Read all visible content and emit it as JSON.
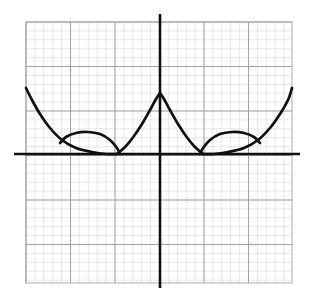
{
  "figure": {
    "kind": "math-function-graph",
    "title": "",
    "background_color": "#ffffff",
    "width": 310,
    "height": 288
  },
  "grid": {
    "minor_color": "#c9ccd2",
    "major_color": "#9a9ea6",
    "frame_color": "#a7abb3",
    "minor_step_px": 8.9,
    "major_step_px": 44.5,
    "left_px": 26,
    "top_px": 22,
    "right_px": 292,
    "bottom_px": 283,
    "minor_cols": 30,
    "minor_rows": 29,
    "major_cols": 6,
    "major_rows": 6
  },
  "axes": {
    "color": "#111111",
    "stroke_width": 2.6,
    "x_axis": {
      "y_px": 154,
      "x_start_px": 14,
      "x_end_px": 300,
      "label": "",
      "ticks": []
    },
    "y_axis": {
      "x_px": 160,
      "y_start_px": 14,
      "y_end_px": 288,
      "label": "",
      "ticks": []
    },
    "origin_px": {
      "x": 160,
      "y": 154
    }
  },
  "chart_data": {
    "type": "line",
    "title": "",
    "xlabel": "",
    "ylabel": "",
    "grid": true,
    "legend": null,
    "symmetry": "even (mirror about y-axis)",
    "series": [
      {
        "name": "left-outer-branch",
        "comment": "Steep branch descending from upper-left grid edge to the tangent point on the x-axis",
        "points_px": [
          [
            26,
            88
          ],
          [
            32,
            100
          ],
          [
            40,
            114
          ],
          [
            50,
            128
          ],
          [
            62,
            140
          ],
          [
            76,
            148
          ],
          [
            92,
            152
          ],
          [
            106,
            154
          ],
          [
            117,
            154
          ]
        ]
      },
      {
        "name": "left-inner-branch",
        "comment": "Rises from the x-axis tangency up to the cusp at the y-axis",
        "points_px": [
          [
            117,
            154
          ],
          [
            126,
            146
          ],
          [
            134,
            136
          ],
          [
            142,
            124
          ],
          [
            150,
            110
          ],
          [
            156,
            99
          ],
          [
            160,
            93
          ]
        ]
      },
      {
        "name": "left-lens-upper-arc",
        "comment": "Upper arc of the left eye/lens closing back onto the outer branch",
        "points_px": [
          [
            60,
            143
          ],
          [
            66,
            137
          ],
          [
            76,
            133
          ],
          [
            88,
            132
          ],
          [
            100,
            134
          ],
          [
            110,
            140
          ],
          [
            117,
            148
          ],
          [
            120,
            154
          ]
        ]
      },
      {
        "name": "right-inner-branch",
        "comment": "Descends from the cusp at the y-axis to the x-axis tangency",
        "points_px": [
          [
            160,
            93
          ],
          [
            164,
            99
          ],
          [
            170,
            110
          ],
          [
            178,
            124
          ],
          [
            186,
            136
          ],
          [
            194,
            146
          ],
          [
            203,
            154
          ]
        ]
      },
      {
        "name": "right-outer-branch",
        "comment": "Steep branch ascending from the x-axis tangency to the upper-right grid edge",
        "points_px": [
          [
            203,
            154
          ],
          [
            214,
            154
          ],
          [
            228,
            152
          ],
          [
            244,
            148
          ],
          [
            258,
            140
          ],
          [
            270,
            128
          ],
          [
            280,
            114
          ],
          [
            288,
            100
          ],
          [
            292,
            88
          ]
        ]
      },
      {
        "name": "right-lens-upper-arc",
        "comment": "Upper arc of the right eye/lens closing back onto the outer branch",
        "points_px": [
          [
            200,
            154
          ],
          [
            203,
            148
          ],
          [
            210,
            140
          ],
          [
            220,
            134
          ],
          [
            232,
            132
          ],
          [
            244,
            133
          ],
          [
            254,
            137
          ],
          [
            260,
            143
          ]
        ]
      }
    ],
    "features": {
      "cusp_px": {
        "x": 160,
        "y": 93
      },
      "x_axis_tangency_px": [
        {
          "x": 117,
          "y": 154
        },
        {
          "x": 203,
          "y": 154
        }
      ],
      "lens_left_span_px": [
        58,
        120
      ],
      "lens_right_span_px": [
        200,
        262
      ],
      "lens_top_px": 132
    }
  }
}
